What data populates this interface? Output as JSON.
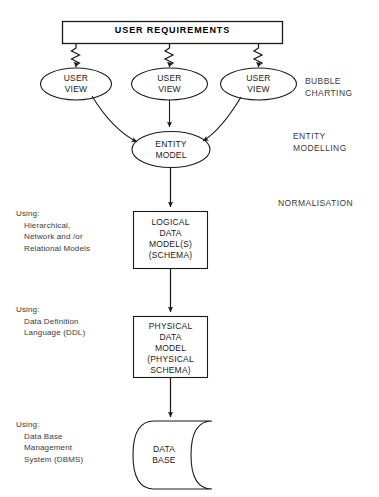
{
  "diagram": {
    "nodes": {
      "user_requirements": "USER REQUIREMENTS",
      "user_view_1": "USER\nVIEW",
      "user_view_2": "USER\nVIEW",
      "user_view_3": "USER\nVIEW",
      "entity_model": "ENTITY\nMODEL",
      "logical_data_model": "LOGICAL\nDATA\nMODEL(S)\n(SCHEMA)",
      "physical_data_model": "PHYSICAL\nDATA\nMODEL\n(PHYSICAL\nSCHEMA)",
      "data_base": "DATA\nBASE"
    },
    "stage_labels": {
      "bubble_charting": "BUBBLE\nCHARTING",
      "entity_modelling": "ENTITY\nMODELLING",
      "normalisation": "NORMALISATION"
    },
    "side_notes": [
      {
        "head": "Using:",
        "body": "Hierarchical,\nNetwork and /or\nRelational Models"
      },
      {
        "head": "Using:",
        "body": "Data Definition\nLanguage (DDL)"
      },
      {
        "head": "Using:",
        "body": "Data Base\nManagement\nSystem (DBMS)"
      }
    ],
    "colors": {
      "stroke": "#1a1a1a",
      "text": "#1a1a1a",
      "note_text": "#3a3a3a",
      "background": "#ffffff"
    }
  }
}
